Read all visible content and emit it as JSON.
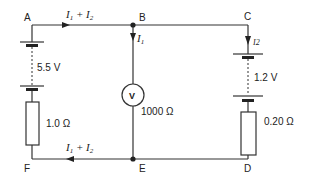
{
  "diagram": {
    "type": "circuit",
    "nodes": [
      {
        "id": "A",
        "label": "A"
      },
      {
        "id": "B",
        "label": "B"
      },
      {
        "id": "C",
        "label": "C"
      },
      {
        "id": "D",
        "label": "D"
      },
      {
        "id": "E",
        "label": "E"
      },
      {
        "id": "F",
        "label": "F"
      }
    ],
    "currents": {
      "top": {
        "main": "I",
        "sub1": "1",
        "plus": " + ",
        "sub2": "2"
      },
      "bottom": {
        "main": "I",
        "sub1": "1",
        "plus": " + ",
        "sub2": "2"
      },
      "branch_b": {
        "main": "I",
        "sub": "1"
      },
      "branch_c": {
        "main": "I2"
      }
    },
    "components": {
      "left_cell": {
        "emf": "5.5 V"
      },
      "left_resistor": {
        "value": "1.0 Ω"
      },
      "voltmeter": {
        "symbol": "V",
        "resistance": "1000 Ω"
      },
      "right_cell": {
        "emf": "1.2 V"
      },
      "right_resistor": {
        "value": "0.20 Ω"
      }
    }
  }
}
